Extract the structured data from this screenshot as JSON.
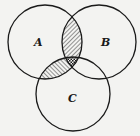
{
  "diagram": {
    "type": "venn",
    "sets": [
      {
        "id": "A",
        "label": "A",
        "cx": 45,
        "cy": 42,
        "r": 37,
        "label_x": 37,
        "label_y": 46
      },
      {
        "id": "B",
        "label": "B",
        "cx": 99,
        "cy": 42,
        "r": 37,
        "label_x": 106,
        "label_y": 46
      },
      {
        "id": "C",
        "label": "C",
        "cx": 73,
        "cy": 94,
        "r": 37,
        "label_x": 70,
        "label_y": 101
      }
    ],
    "shaded_regions": [
      {
        "region": "A∩B only",
        "pattern": "diagonal-forward"
      },
      {
        "region": "A∩C only",
        "pattern": "diagonal-backward"
      },
      {
        "region": "A∩B∩C",
        "pattern": "crosshatch"
      }
    ],
    "colors": {
      "stroke": "#1a1a1a",
      "background": "#f3f3f1"
    }
  }
}
